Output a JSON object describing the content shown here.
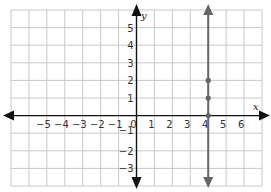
{
  "chart_data": {
    "type": "line",
    "title": "",
    "xlabel": "x",
    "ylabel": "y",
    "xlim": [
      -7,
      7
    ],
    "ylim": [
      -4,
      6
    ],
    "grid": true,
    "x_ticks": [
      "−5",
      "−4",
      "−3",
      "−2",
      "−1",
      "0",
      "1",
      "2",
      "3",
      "4",
      "5",
      "6"
    ],
    "y_ticks": [
      "5",
      "4",
      "3",
      "2",
      "1",
      "−1",
      "−2",
      "−3"
    ],
    "series": [
      {
        "name": "x = 4",
        "kind": "vertical line",
        "x": 4,
        "color": "#666666",
        "points": [
          {
            "x": 4,
            "y": 0
          },
          {
            "x": 4,
            "y": 1
          },
          {
            "x": 4,
            "y": 2
          }
        ]
      }
    ]
  },
  "labels": {
    "x_axis": "x",
    "y_axis": "y",
    "x_tick_values": [
      -5,
      -4,
      -3,
      -2,
      -1,
      0,
      1,
      2,
      3,
      4,
      5,
      6
    ],
    "y_tick_values": [
      5,
      4,
      3,
      2,
      1,
      -1,
      -2,
      -3
    ]
  },
  "colors": {
    "grid": "#c8c8c8",
    "axis": "#111111",
    "line": "#666666",
    "points": "#666666"
  }
}
